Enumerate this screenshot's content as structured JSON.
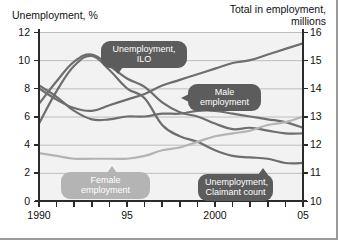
{
  "figure": {
    "left_axis_title": "Unemployment, %",
    "right_axis_title": "Total in employment,\nmillions"
  },
  "chart_data": {
    "type": "line",
    "title": "",
    "subtitle": "",
    "xlabel": "",
    "ylabel": "Unemployment, %",
    "y2label": "Total in employment, millions",
    "grid": true,
    "legend": "annotations",
    "x": [
      1990,
      1991,
      1992,
      1993,
      1994,
      1995,
      1996,
      1997,
      1998,
      1999,
      2000,
      2001,
      2002,
      2003,
      2004,
      2005
    ],
    "xlim": [
      1990,
      2005
    ],
    "xticks": [
      1990,
      1991,
      1992,
      1993,
      1994,
      1995,
      1996,
      1997,
      1998,
      1999,
      2000,
      2001,
      2002,
      2003,
      2004,
      2005
    ],
    "xticklabels": [
      "1990",
      "",
      "",
      "",
      "",
      "95",
      "",
      "",
      "",
      "",
      "2000",
      "",
      "",
      "",
      "",
      "05"
    ],
    "ylim": [
      0,
      12
    ],
    "yticks": [
      0,
      2,
      4,
      6,
      8,
      10,
      12
    ],
    "yticklabels": [
      "0",
      "2",
      "4",
      "6",
      "8",
      "10",
      "12"
    ],
    "y2lim": [
      10,
      16
    ],
    "y2ticks": [
      10,
      11,
      12,
      13,
      14,
      15,
      16
    ],
    "y2ticklabels": [
      "10",
      "11",
      "12",
      "13",
      "14",
      "15",
      "16"
    ],
    "series": [
      {
        "name": "Unemployment, ILO",
        "axis": "left",
        "units": "%",
        "color": "#6e6e6e",
        "values": [
          6.9,
          8.5,
          9.9,
          10.4,
          9.6,
          8.7,
          8.1,
          7.0,
          6.3,
          6.0,
          5.5,
          5.1,
          5.2,
          5.0,
          4.8,
          4.8
        ]
      },
      {
        "name": "Unemployment, Claimant count",
        "axis": "left",
        "units": "%",
        "color": "#6e6e6e",
        "values": [
          5.5,
          7.8,
          9.6,
          10.3,
          9.3,
          8.0,
          7.3,
          5.4,
          4.6,
          4.2,
          3.6,
          3.2,
          3.1,
          3.0,
          2.7,
          2.7
        ]
      },
      {
        "name": "Male employment",
        "axis": "right",
        "units": "millions",
        "color": "#6e6e6e",
        "values": [
          14.1,
          13.7,
          13.2,
          12.9,
          12.9,
          13.0,
          13.0,
          13.1,
          13.1,
          13.2,
          13.2,
          13.1,
          13.0,
          12.9,
          12.8,
          12.6
        ]
      },
      {
        "name": "Female employment",
        "axis": "right",
        "units": "millions",
        "color": "#b4b4b4",
        "values": [
          11.7,
          11.6,
          11.5,
          11.5,
          11.5,
          11.5,
          11.6,
          11.8,
          11.9,
          12.1,
          12.3,
          12.4,
          12.5,
          12.7,
          12.8,
          13.0
        ]
      },
      {
        "name": "Total in employment",
        "axis": "right",
        "units": "millions",
        "color": "#6e6e6e",
        "values": [
          14.0,
          13.6,
          13.3,
          13.2,
          13.4,
          13.6,
          13.8,
          14.1,
          14.3,
          14.5,
          14.7,
          14.9,
          15.0,
          15.2,
          15.4,
          15.6
        ]
      }
    ],
    "annotations": [
      {
        "text": "Unemployment, ILO",
        "style": "dark"
      },
      {
        "text": "Male employment",
        "style": "dark"
      },
      {
        "text": "Female employment",
        "style": "light"
      },
      {
        "text": "Unemployment,\nClaimant count",
        "style": "dark"
      }
    ]
  },
  "colors": {
    "plot_background": "#f2f2f2",
    "gridline": "#b7b7b7",
    "axis": "#2b2b2b",
    "line_dark": "#6e6e6e",
    "line_light": "#b4b4b4",
    "callout_dark": "#5c5c5c",
    "callout_light": "#b4b4b4"
  }
}
